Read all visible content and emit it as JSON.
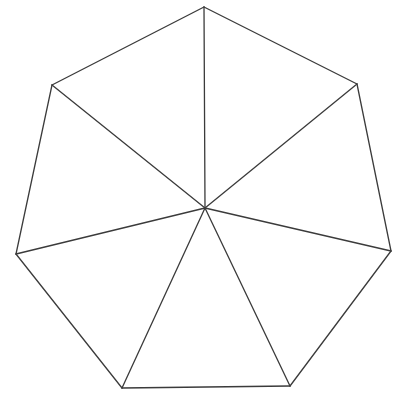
{
  "figure": {
    "shape_name": "heptagon",
    "side_count": 7,
    "triangle_count": 7,
    "background_color": "#ffffff",
    "stroke_color": "#3b3b3b",
    "fill_color": "#ffffff",
    "stroke_width": 1.3,
    "canvas": {
      "width": 404,
      "height": 408
    }
  },
  "chart_data": {
    "type": "diagram",
    "center": {
      "label": "center",
      "x": 205,
      "y": 208
    },
    "vertices": [
      {
        "label": "top",
        "x": 204,
        "y": 7
      },
      {
        "label": "upper-right",
        "x": 357,
        "y": 84
      },
      {
        "label": "right",
        "x": 391,
        "y": 251
      },
      {
        "label": "bottom-right",
        "x": 290,
        "y": 386
      },
      {
        "label": "bottom-left",
        "x": 122,
        "y": 388
      },
      {
        "label": "left",
        "x": 16,
        "y": 254
      },
      {
        "label": "upper-left",
        "x": 52,
        "y": 85
      }
    ],
    "polygon_path": "M 204 7 L 357 84 L 391 251 L 290 386 L 122 388 L 16 254 L 52 85 Z",
    "spokes": [
      {
        "name": "spoke-to-top",
        "x1": 205,
        "y1": 208,
        "x2": 204,
        "y2": 7
      },
      {
        "name": "spoke-to-upper-right",
        "x1": 205,
        "y1": 208,
        "x2": 357,
        "y2": 84
      },
      {
        "name": "spoke-to-right",
        "x1": 205,
        "y1": 208,
        "x2": 391,
        "y2": 251
      },
      {
        "name": "spoke-to-bottom-right",
        "x1": 205,
        "y1": 208,
        "x2": 290,
        "y2": 386
      },
      {
        "name": "spoke-to-bottom-left",
        "x1": 205,
        "y1": 208,
        "x2": 122,
        "y2": 388
      },
      {
        "name": "spoke-to-left",
        "x1": 205,
        "y1": 208,
        "x2": 16,
        "y2": 254
      },
      {
        "name": "spoke-to-upper-left",
        "x1": 205,
        "y1": 208,
        "x2": 52,
        "y2": 85
      }
    ],
    "edges": [
      {
        "name": "edge-top-to-upper-right",
        "x1": 204,
        "y1": 7,
        "x2": 357,
        "y2": 84
      },
      {
        "name": "edge-upper-right-to-right",
        "x1": 357,
        "y1": 84,
        "x2": 391,
        "y2": 251
      },
      {
        "name": "edge-right-to-bottom-right",
        "x1": 391,
        "y1": 251,
        "x2": 290,
        "y2": 386
      },
      {
        "name": "edge-bottom-right-to-bottom-left",
        "x1": 290,
        "y1": 386,
        "x2": 122,
        "y2": 388
      },
      {
        "name": "edge-bottom-left-to-left",
        "x1": 122,
        "y1": 388,
        "x2": 16,
        "y2": 254
      },
      {
        "name": "edge-left-to-upper-left",
        "x1": 16,
        "y1": 254,
        "x2": 52,
        "y2": 85
      },
      {
        "name": "edge-upper-left-to-top",
        "x1": 52,
        "y1": 85,
        "x2": 204,
        "y2": 7
      }
    ],
    "labels": [],
    "legend": [],
    "grid": false
  }
}
